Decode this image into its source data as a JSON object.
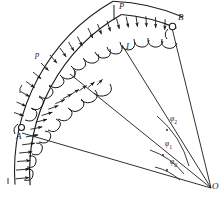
{
  "figure": {
    "background_color": "#ffffff",
    "ink_color": "#1a1a1a",
    "width": 224,
    "height": 197
  },
  "points": {
    "A": {
      "label": "A",
      "x": 18,
      "y": 131,
      "note": "left support of arch, pin/hinge"
    },
    "B": {
      "label": "B",
      "x": 176,
      "y": 25,
      "note": "right support of arch, pin/hinge"
    },
    "O": {
      "label": "O",
      "x": 211,
      "y": 188,
      "note": "center of circular arc"
    },
    "I": {
      "label": "I",
      "x": 74,
      "y": 75,
      "note": "section marker on arch"
    },
    "I2": {
      "label": "I",
      "x": 126,
      "y": 47,
      "note": "second section marker on arch"
    }
  },
  "loads": {
    "distributed_left": {
      "label": "p",
      "x": 36,
      "y": 55
    },
    "concentrated_top": {
      "label": "P",
      "x": 121,
      "y": 6
    }
  },
  "angles": [
    {
      "label": "φ",
      "subscript": "0",
      "x": 173,
      "y": 163
    },
    {
      "label": "φ",
      "subscript": "1",
      "x": 169,
      "y": 146
    },
    {
      "label": "φ",
      "subscript": "2",
      "x": 173,
      "y": 121
    }
  ],
  "geometry": {
    "center_x": 211,
    "center_y": 188,
    "outer_radius": 196,
    "inner_radius": 183,
    "arc_start_deg": 179,
    "arc_end_deg": 120,
    "radial_lines": 4,
    "arrow_count": 18,
    "scallop_count": 13
  }
}
